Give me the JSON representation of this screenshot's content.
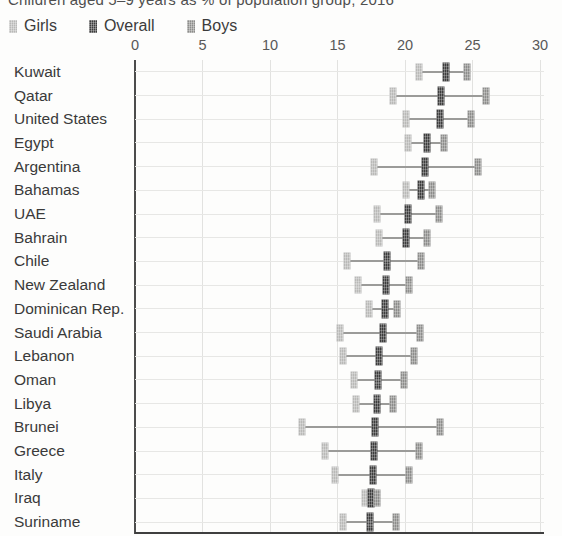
{
  "title": "Children aged 5–9 years as % of population group, 2016",
  "legend": {
    "items": [
      {
        "label": "Girls",
        "color": "#b9b9b7"
      },
      {
        "label": "Overall",
        "color": "#3d3d3d"
      },
      {
        "label": "Boys",
        "color": "#8d8d8b"
      }
    ]
  },
  "colors": {
    "girls": "#b9b9b7",
    "overall": "#3d3d3d",
    "boys": "#8d8d8b",
    "range_line": "#9b9b99",
    "zero_axis": "#4c4c4c",
    "gridline": "#e2e2e0",
    "baseline": "#3f3f3f"
  },
  "chart_data": {
    "type": "scatter",
    "subtype": "dot-range",
    "title": "Children aged 5–9 years as % of population group, 2016",
    "xlabel": "",
    "ylabel": "",
    "xlim": [
      0,
      30
    ],
    "xticks": [
      0,
      5,
      10,
      15,
      20,
      25,
      30
    ],
    "grid": true,
    "legend_position": "top",
    "categories": [
      "Kuwait",
      "Qatar",
      "United States",
      "Egypt",
      "Argentina",
      "Bahamas",
      "UAE",
      "Bahrain",
      "Chile",
      "New Zealand",
      "Dominican Rep.",
      "Saudi Arabia",
      "Lebanon",
      "Oman",
      "Libya",
      "Brunei",
      "Greece",
      "Italy",
      "Iraq",
      "Suriname"
    ],
    "series": [
      {
        "name": "Girls",
        "values": [
          21.0,
          19.1,
          20.1,
          20.2,
          17.7,
          20.1,
          17.9,
          18.1,
          15.7,
          16.5,
          17.3,
          15.2,
          15.4,
          16.2,
          16.4,
          12.4,
          14.1,
          14.8,
          17.0,
          15.4
        ]
      },
      {
        "name": "Overall",
        "values": [
          23.0,
          22.7,
          22.6,
          21.6,
          21.5,
          21.2,
          20.2,
          20.1,
          18.7,
          18.6,
          18.5,
          18.4,
          18.1,
          18.0,
          17.9,
          17.8,
          17.7,
          17.6,
          17.5,
          17.4
        ]
      },
      {
        "name": "Boys",
        "values": [
          24.6,
          26.0,
          24.9,
          22.9,
          25.4,
          22.0,
          22.5,
          21.6,
          21.2,
          20.3,
          19.4,
          21.1,
          20.7,
          19.9,
          19.1,
          22.6,
          21.0,
          20.3,
          17.9,
          19.3
        ]
      }
    ]
  }
}
